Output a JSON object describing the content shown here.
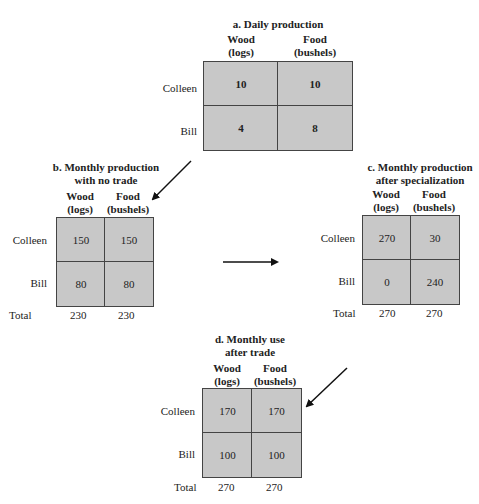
{
  "column_headers": [
    {
      "line1": "Wood",
      "line2": "(logs)"
    },
    {
      "line1": "Food",
      "line2": "(bushels)"
    }
  ],
  "row_labels": [
    "Colleen",
    "Bill"
  ],
  "total_label": "Total",
  "panels": {
    "a": {
      "title_line1": "a. Daily production",
      "values": [
        [
          "10",
          "10"
        ],
        [
          "4",
          "8"
        ]
      ]
    },
    "b": {
      "title_line1": "b. Monthly production",
      "title_line2": "with no trade",
      "values": [
        [
          "150",
          "150"
        ],
        [
          "80",
          "80"
        ]
      ],
      "totals": [
        "230",
        "230"
      ]
    },
    "c": {
      "title_line1": "c. Monthly production",
      "title_line2": "after specialization",
      "values": [
        [
          "270",
          "30"
        ],
        [
          "0",
          "240"
        ]
      ],
      "totals": [
        "270",
        "270"
      ]
    },
    "d": {
      "title_line1": "d. Monthly use",
      "title_line2": "after trade",
      "values": [
        [
          "170",
          "170"
        ],
        [
          "100",
          "100"
        ]
      ],
      "totals": [
        "270",
        "270"
      ]
    }
  },
  "colors": {
    "cell_fill": "#c8c8c8",
    "grid_line": "#444444",
    "arrow": "#111111"
  }
}
